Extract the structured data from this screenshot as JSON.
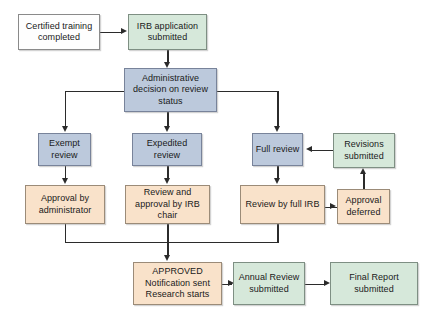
{
  "diagram": {
    "palette": {
      "white": "#fefefe",
      "green": "#d6e8da",
      "blue": "#bcc9dc",
      "peach": "#f9e2ca",
      "border": "#8a8a8a",
      "connector": "#2b2b2b",
      "background": "#ffffff"
    },
    "nodes": {
      "certified_training": "Certified training completed",
      "irb_application": "IRB application submitted",
      "administrative_decision": "Administrative decision on review status",
      "exempt_review": "Exempt review",
      "expedited_review": "Expedited review",
      "full_review": "Full review",
      "revisions_submitted": "Revisions submitted",
      "approval_administrator": "Approval by administrator",
      "approval_irb_chair": "Review and approval by IRB chair",
      "review_full_irb": "Review by full IRB",
      "approval_deferred": "Approval deferred",
      "approved_line1": "APPROVED",
      "approved_line2": "Notification sent",
      "approved_line3": "Research starts",
      "annual_review": "Annual Review submitted",
      "final_report": "Final Report submitted"
    }
  }
}
